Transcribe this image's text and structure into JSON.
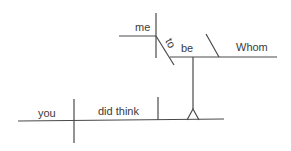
{
  "diagram": {
    "type": "sentence-diagram",
    "sentence": "Whom did you think me to be?",
    "words": {
      "subject": "you",
      "verb": "did think",
      "infinitive_subject": "me",
      "infinitive_to": "to",
      "infinitive_verb": "be",
      "complement": "Whom"
    },
    "colors": {
      "line": "#4a4a4a",
      "text": "#3a3a3a",
      "background": "#ffffff"
    }
  }
}
